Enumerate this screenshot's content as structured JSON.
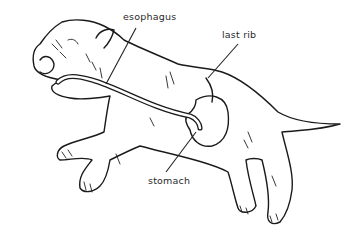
{
  "diagram": {
    "labels": [
      {
        "id": "esophagus",
        "text": "esophagus"
      },
      {
        "id": "last-rib",
        "text": "last rib"
      },
      {
        "id": "stomach",
        "text": "stomach"
      }
    ],
    "colors": {
      "background": "#ffffff",
      "line": "#1a1a1a",
      "text": "#2a2a2a"
    }
  }
}
